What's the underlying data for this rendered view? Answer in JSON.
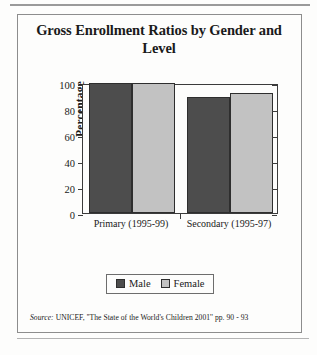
{
  "figure": {
    "title": "Gross Enrollment Ratios by Gender and Level",
    "source_label": "Source:",
    "source_text": "UNICEF, ''The State of the World's Children 2001'' pp. 90 - 93"
  },
  "legend": {
    "position": "bottom-center",
    "entries": [
      {
        "label": "Male",
        "color": "#4d4d4d"
      },
      {
        "label": "Female",
        "color": "#c2c2c2"
      }
    ]
  },
  "chart_data": {
    "type": "bar",
    "title": "Gross Enrollment Ratios by Gender and Level",
    "xlabel": "",
    "ylabel": "Percentage",
    "categories": [
      "Primary (1995-99)",
      "Secondary (1995-97)"
    ],
    "series": [
      {
        "name": "Male",
        "color": "#4d4d4d",
        "values": [
          100,
          89
        ]
      },
      {
        "name": "Female",
        "color": "#c2c2c2",
        "values": [
          100,
          92
        ]
      }
    ],
    "ylim": [
      0,
      100
    ],
    "yticks": [
      0,
      20,
      40,
      60,
      80,
      100
    ],
    "ytick_labels": [
      "0",
      "20",
      "40",
      "60",
      "80",
      "100"
    ],
    "grid": false,
    "legend": true
  }
}
